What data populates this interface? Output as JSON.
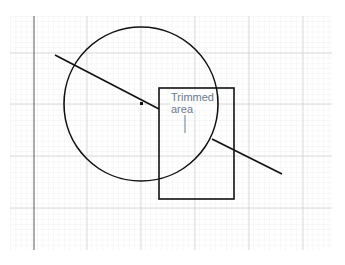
{
  "diagram": {
    "annotation": {
      "line1": "Trimmed",
      "line2": "area"
    },
    "colors": {
      "grid_minor": "#e6e6e6",
      "grid_major": "#cfcfcf",
      "axis": "#555555",
      "shape": "#111111",
      "annotation": "#6a7a90"
    },
    "shapes": {
      "circle": {
        "cx": 141,
        "cy": 104,
        "r": 77
      },
      "rectangle": {
        "x": 159,
        "y": 88,
        "w": 75,
        "h": 111
      },
      "line": {
        "x1": 55,
        "y1": 55,
        "x2": 282,
        "y2": 174
      },
      "center_point": {
        "x": 141,
        "y": 103
      }
    }
  }
}
